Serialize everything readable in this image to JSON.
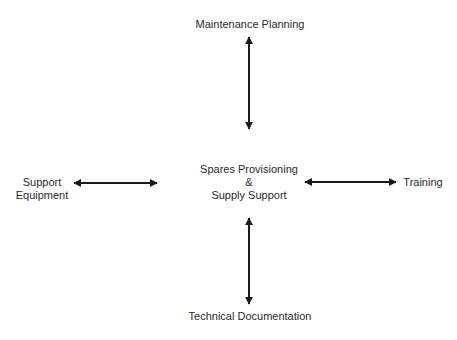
{
  "diagram": {
    "center": {
      "line1": "Spares Provisioning",
      "line2": "&",
      "line3": "Supply Support"
    },
    "top": "Maintenance Planning",
    "bottom": "Technical Documentation",
    "left": {
      "line1": "Support",
      "line2": "Equipment"
    },
    "right": "Training",
    "edges": [
      {
        "from": "Spares Provisioning & Supply Support",
        "to": "Maintenance Planning",
        "type": "bidirectional"
      },
      {
        "from": "Spares Provisioning & Supply Support",
        "to": "Technical Documentation",
        "type": "bidirectional"
      },
      {
        "from": "Spares Provisioning & Supply Support",
        "to": "Support Equipment",
        "type": "bidirectional"
      },
      {
        "from": "Spares Provisioning & Supply Support",
        "to": "Training",
        "type": "bidirectional"
      }
    ]
  }
}
